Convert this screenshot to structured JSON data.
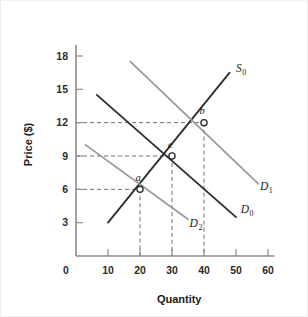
{
  "chart_data": {
    "type": "line",
    "title": "",
    "xlabel": "Quantity",
    "ylabel": "Price ($)",
    "xlim": [
      0,
      62
    ],
    "ylim": [
      0,
      19
    ],
    "xticks": [
      0,
      10,
      20,
      30,
      40,
      50,
      60
    ],
    "xtick_labels": [
      "0",
      "10",
      "20",
      "30",
      "40",
      "50",
      "60"
    ],
    "yticks": [
      3,
      6,
      9,
      12,
      15,
      18
    ],
    "ytick_labels": [
      "3",
      "6",
      "9",
      "12",
      "15",
      "18"
    ],
    "grid": false,
    "legend_position": "inline-curve-labels",
    "series": [
      {
        "name": "S0",
        "label_base": "S",
        "label_sub": "0",
        "role": "supply",
        "color": "#2b2b2b",
        "style": "solid",
        "x": [
          10,
          48
        ],
        "y": [
          3.0,
          16.5
        ],
        "label_x": 50,
        "label_y": 16.6
      },
      {
        "name": "D0",
        "label_base": "D",
        "label_sub": "0",
        "role": "demand-original",
        "color": "#2b2b2b",
        "style": "solid",
        "x": [
          6.5,
          50
        ],
        "y": [
          14.5,
          3.5
        ],
        "label_x": 51.5,
        "label_y": 3.9
      },
      {
        "name": "D1",
        "label_base": "D",
        "label_sub": "1",
        "role": "demand-increased",
        "color": "#9a9a9a",
        "style": "solid",
        "x": [
          17,
          57
        ],
        "y": [
          17.5,
          6.5
        ],
        "label_x": 57.5,
        "label_y": 5.9
      },
      {
        "name": "D2",
        "label_base": "D",
        "label_sub": "2",
        "role": "demand-decreased",
        "color": "#9a9a9a",
        "style": "solid",
        "x": [
          3,
          35
        ],
        "y": [
          10.0,
          3.3
        ],
        "label_x": 35.5,
        "label_y": 2.6
      }
    ],
    "points": [
      {
        "label": "a",
        "x": 20,
        "y": 6,
        "description": "intersection of S0 and D2",
        "label_dx": -1.0,
        "label_dy": 1.5,
        "guides": [
          "vertical",
          "horizontal"
        ]
      },
      {
        "label": "e",
        "x": 30,
        "y": 9,
        "description": "intersection of S0 and D0",
        "label_dx": -1.0,
        "label_dy": 1.5,
        "guides": [
          "vertical",
          "horizontal"
        ]
      },
      {
        "label": "b",
        "x": 40,
        "y": 12,
        "description": "intersection of S0 and D1",
        "label_dx": -1.0,
        "label_dy": 1.5,
        "guides": [
          "vertical",
          "horizontal"
        ]
      }
    ],
    "annotations": []
  }
}
